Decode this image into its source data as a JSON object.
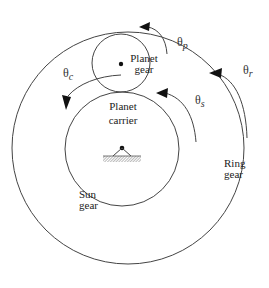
{
  "diagram": {
    "colors": {
      "line": "#444444",
      "text": "#222222",
      "background": "#ffffff"
    },
    "labels": {
      "planet_gear": {
        "line1": "Planet",
        "line2": "gear"
      },
      "planet_carrier": {
        "line1": "Planet",
        "line2": "carrier"
      },
      "sun_gear": {
        "line1": "Sun",
        "line2": "gear"
      },
      "ring_gear": {
        "line1": "Ring",
        "line2": "gear"
      }
    },
    "angles": {
      "theta_p": {
        "symbol": "θ",
        "sub": "p"
      },
      "theta_r": {
        "symbol": "θ",
        "sub": "r"
      },
      "theta_s": {
        "symbol": "θ",
        "sub": "s"
      },
      "theta_c": {
        "symbol": "θ",
        "sub": "c"
      }
    },
    "shapes": {
      "ring_gear_circle": {
        "cx": 128,
        "cy": 148,
        "r": 116
      },
      "sun_gear_circle": {
        "cx": 122,
        "cy": 149,
        "r": 57
      },
      "planet_gear_circle": {
        "cx": 121,
        "cy": 63,
        "r": 29
      },
      "ground_support": {
        "pivot_x": 122,
        "pivot_y": 148
      }
    }
  }
}
